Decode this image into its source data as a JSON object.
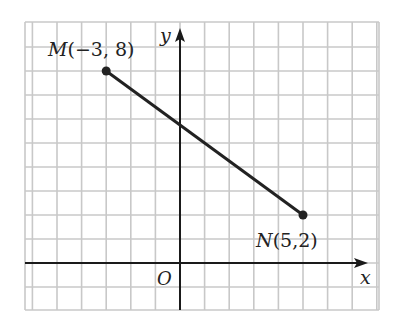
{
  "figure": {
    "type": "coordinate-plane",
    "axes": {
      "x_label": "x",
      "y_label": "y",
      "origin_label": "O"
    },
    "grid": {
      "unit_px_x": 24.6,
      "unit_px_y": 24.0,
      "origin_px": [
        180,
        263
      ],
      "x_range": [
        -6,
        8
      ],
      "y_range": [
        -2,
        10
      ],
      "line_color": "#c8c8c8"
    },
    "points": [
      {
        "name": "M",
        "coords": "(−3, 8)",
        "x": -3,
        "y": 8
      },
      {
        "name": "N",
        "coords": "(5,2)",
        "x": 5,
        "y": 2
      }
    ],
    "segment": {
      "from": "M",
      "to": "N",
      "color": "#222222"
    }
  }
}
